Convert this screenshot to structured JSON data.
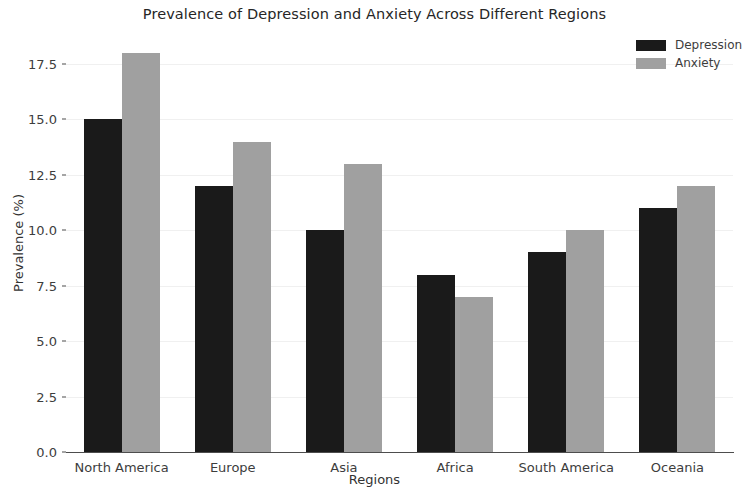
{
  "chart_data": {
    "type": "bar",
    "title": "Prevalence of Depression and Anxiety Across Different Regions",
    "xlabel": "Regions",
    "ylabel": "Prevalence (%)",
    "categories": [
      "North America",
      "Europe",
      "Asia",
      "Africa",
      "South America",
      "Oceania"
    ],
    "series": [
      {
        "name": "Depression",
        "color": "#1a1a1a",
        "values": [
          15.0,
          12.0,
          10.0,
          8.0,
          9.0,
          11.0
        ]
      },
      {
        "name": "Anxiety",
        "color": "#a0a0a0",
        "values": [
          18.0,
          14.0,
          13.0,
          7.0,
          10.0,
          12.0
        ]
      }
    ],
    "ylim": [
      0.0,
      18.9
    ],
    "yticks": [
      "0.0",
      "2.5",
      "5.0",
      "7.5",
      "10.0",
      "12.5",
      "15.0",
      "17.5"
    ],
    "ytick_values": [
      0.0,
      2.5,
      5.0,
      7.5,
      10.0,
      12.5,
      15.0,
      17.5
    ],
    "grid": true,
    "legend_position": "upper right"
  }
}
